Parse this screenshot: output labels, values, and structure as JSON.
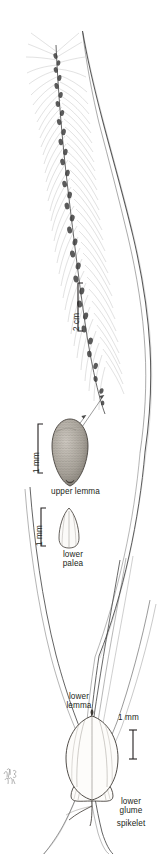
{
  "figure": {
    "kind": "botanical-line-illustration",
    "background_color": "#ffffff",
    "ink_color": "#231f20",
    "width_px": 167,
    "height_px": 854
  },
  "scale_bars": [
    {
      "id": "scale-2cm",
      "label": "2 cm",
      "orientation": "vertical",
      "bracket": "square",
      "x": 78,
      "y_top": 283,
      "y_bottom": 331
    },
    {
      "id": "scale-1mm-upper-lemma",
      "label": "1 mm",
      "orientation": "vertical",
      "bracket": "square",
      "x": 38,
      "y_top": 424,
      "y_bottom": 473
    },
    {
      "id": "scale-1mm-lower-palea",
      "label": "1 mm",
      "orientation": "vertical",
      "bracket": "square",
      "x": 41,
      "y_top": 508,
      "y_bottom": 546
    },
    {
      "id": "scale-1mm-spikelet",
      "label": "1 mm",
      "orientation": "vertical",
      "bracket": "serif",
      "x": 133,
      "y_top": 730,
      "y_bottom": 759
    }
  ],
  "labels": {
    "upper_lemma": "upper lemma",
    "lower_palea_line1": "lower",
    "lower_palea_line2": "palea",
    "lower_lemma_line1": "lower",
    "lower_lemma_line2": "lemma",
    "lower_glume_line1": "lower",
    "lower_glume_line2": "glume",
    "spikelet": "spikelet"
  },
  "parts": [
    {
      "name": "inflorescence",
      "description": "narrow bristly spike-like panicle with dense spikelets and long fine bristles"
    },
    {
      "name": "leaf-blade",
      "description": "long arching linear leaf blade"
    },
    {
      "name": "culm",
      "description": "slender stem"
    },
    {
      "name": "upper-lemma",
      "description": "ovoid, finely transversely rugose upper lemma, magnified"
    },
    {
      "name": "lower-palea",
      "description": "narrow obovate lower palea, magnified"
    },
    {
      "name": "spikelet",
      "description": "ovate spikelet showing lower glume and lower lemma, magnified"
    }
  ],
  "signature": {
    "text": "artist monogram",
    "present": true
  }
}
